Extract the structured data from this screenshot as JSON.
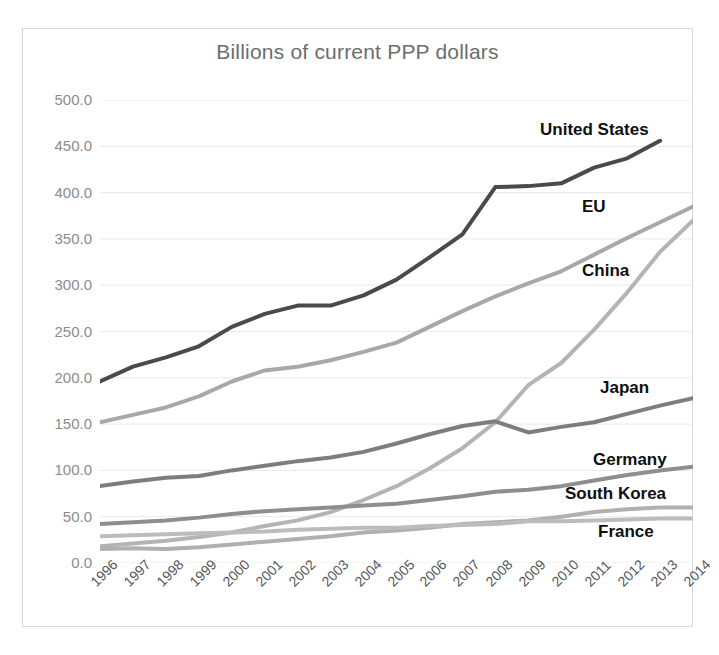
{
  "chart_data": {
    "type": "line",
    "title": "Billions of current PPP dollars",
    "xlabel": "",
    "ylabel": "",
    "ylim": [
      0,
      500
    ],
    "ytick_step": 50,
    "grid": true,
    "legend_position": "inline-right-end-labels",
    "ytick_labels": [
      "500.0",
      "450.0",
      "400.0",
      "350.0",
      "300.0",
      "250.0",
      "200.0",
      "150.0",
      "100.0",
      "50.0",
      "0.0"
    ],
    "categories": [
      "1996",
      "1997",
      "1998",
      "1999",
      "2000",
      "2001",
      "2002",
      "2003",
      "2004",
      "2005",
      "2006",
      "2007",
      "2008",
      "2009",
      "2010",
      "2011",
      "2012",
      "2013",
      "2014"
    ],
    "series": [
      {
        "name": "United States",
        "color": "#4a4a4a",
        "label_x": 540,
        "label_y": 121,
        "values": [
          196,
          212,
          222,
          234,
          255,
          269,
          278,
          278,
          289,
          306,
          330,
          355,
          406,
          407,
          410,
          427,
          437,
          456,
          null
        ]
      },
      {
        "name": "EU",
        "color": "#a8a8a8",
        "label_x": 582,
        "label_y": 198,
        "values": [
          152,
          160,
          168,
          180,
          196,
          208,
          212,
          219,
          228,
          238,
          255,
          272,
          288,
          302,
          315,
          333,
          351,
          368,
          385
        ]
      },
      {
        "name": "China",
        "color": "#b4b4b4",
        "label_x": 582,
        "label_y": 262,
        "values": [
          18,
          21,
          24,
          28,
          33,
          40,
          46,
          55,
          68,
          83,
          102,
          124,
          152,
          192,
          216,
          252,
          292,
          336,
          370
        ]
      },
      {
        "name": "Japan",
        "color": "#7d7d7d",
        "label_x": 600,
        "label_y": 379,
        "values": [
          83,
          88,
          92,
          94,
          100,
          105,
          110,
          114,
          120,
          129,
          139,
          148,
          153,
          141,
          147,
          152,
          161,
          170,
          178
        ]
      },
      {
        "name": "Germany",
        "color": "#8e8e8e",
        "label_x": 593,
        "label_y": 451,
        "values": [
          42,
          44,
          46,
          49,
          53,
          56,
          58,
          60,
          62,
          64,
          68,
          72,
          77,
          79,
          83,
          89,
          95,
          100,
          104
        ]
      },
      {
        "name": "South Korea",
        "color": "#b0b0b0",
        "label_x": 565,
        "label_y": 485,
        "values": [
          15,
          16,
          15,
          17,
          20,
          23,
          26,
          29,
          33,
          35,
          38,
          42,
          44,
          46,
          50,
          55,
          58,
          60,
          60
        ]
      },
      {
        "name": "France",
        "color": "#bcbcbc",
        "label_x": 598,
        "label_y": 523,
        "values": [
          29,
          30,
          31,
          32,
          33,
          34,
          36,
          37,
          38,
          38,
          40,
          41,
          42,
          45,
          45,
          46,
          47,
          48,
          48
        ]
      }
    ]
  }
}
